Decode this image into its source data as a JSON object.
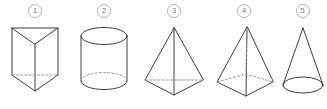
{
  "page": {
    "background_color": "#fdfdfd",
    "width": 327,
    "height": 109,
    "edge_color": "#2b2b2b",
    "hidden_edge_color": "#9a9a9a",
    "label_color": "#7d7d7d"
  },
  "figures": [
    {
      "label": "1",
      "name": "triangular-prism",
      "description": "Triangular prism with dashed hidden bottom back edge"
    },
    {
      "label": "2",
      "name": "cylinder",
      "description": "Cylinder with full top ellipse and dashed hidden back arc on bottom ellipse"
    },
    {
      "label": "3",
      "name": "triangular-pyramid",
      "description": "Triangular pyramid (tetrahedron) with dashed hidden back base edge"
    },
    {
      "label": "4",
      "name": "square-pyramid",
      "description": "Square pyramid with dashed hidden back base edges and dashed lateral edge"
    },
    {
      "label": "5",
      "name": "cone",
      "description": "Cone with elliptical base"
    }
  ]
}
